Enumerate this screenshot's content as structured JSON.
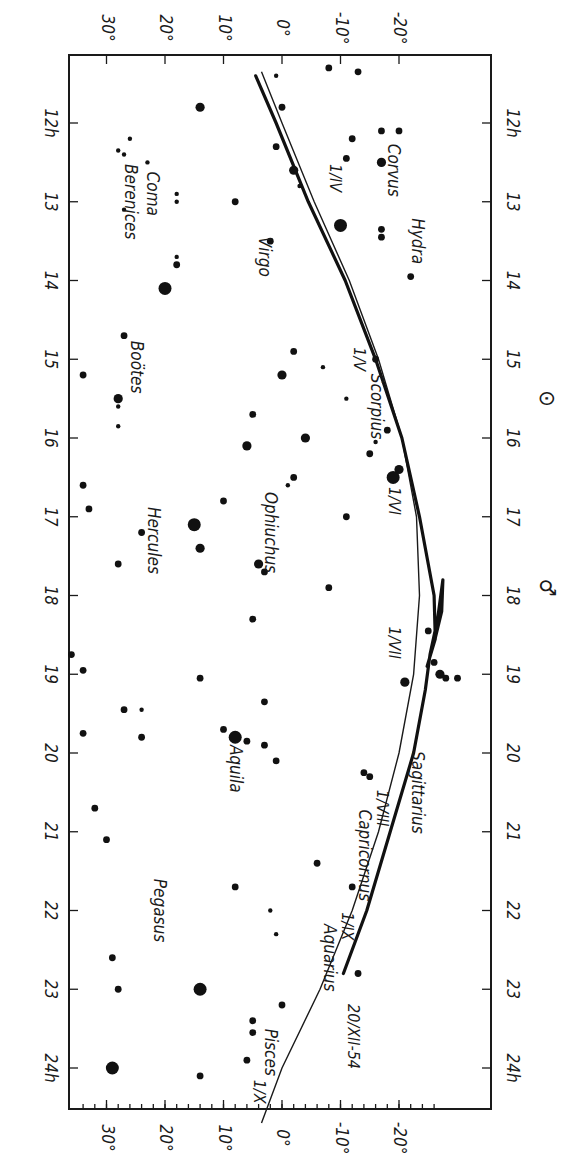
{
  "chart_data": {
    "type": "scatter",
    "title": "",
    "orientation": "rotated 90° clockwise (right ascension runs down the page, declination across)",
    "xlabel": "Right Ascension (h)",
    "ylabel": "Declination (°)",
    "ra_ticks": [
      "12h",
      "13",
      "14",
      "15",
      "16",
      "17",
      "18",
      "19",
      "20",
      "21",
      "22",
      "23",
      "24h"
    ],
    "dec_ticks": [
      "30°",
      "20°",
      "10°",
      "0°",
      "-10°",
      "-20°"
    ],
    "ra_range": [
      11.1,
      25.0
    ],
    "dec_range": [
      36,
      -27
    ],
    "constellations": [
      {
        "name": "Coma Berenices",
        "ra": 13.0,
        "dec": 24
      },
      {
        "name": "Boötes",
        "ra": 15.1,
        "dec": 25
      },
      {
        "name": "Hercules",
        "ra": 17.3,
        "dec": 22
      },
      {
        "name": "Pegasus",
        "ra": 22.0,
        "dec": 21
      },
      {
        "name": "Virgo",
        "ra": 13.7,
        "dec": 3
      },
      {
        "name": "Ophiuchus",
        "ra": 17.2,
        "dec": 2
      },
      {
        "name": "Aquila",
        "ra": 20.2,
        "dec": 8
      },
      {
        "name": "Aquarius",
        "ra": 22.6,
        "dec": -8
      },
      {
        "name": "Pisces",
        "ra": 23.8,
        "dec": 2
      },
      {
        "name": "Corvus",
        "ra": 12.6,
        "dec": -19
      },
      {
        "name": "Hydra",
        "ra": 13.5,
        "dec": -23
      },
      {
        "name": "Scorpius",
        "ra": 15.6,
        "dec": -16
      },
      {
        "name": "Capricornus",
        "ra": 21.3,
        "dec": -14
      },
      {
        "name": "Sagittarius",
        "ra": 20.5,
        "dec": -23
      }
    ],
    "series": [
      {
        "name": "Ecliptic",
        "type": "line",
        "points": [
          [
            11.35,
            3.5
          ],
          [
            12,
            0
          ],
          [
            13,
            -5.5
          ],
          [
            14,
            -11.5
          ],
          [
            15,
            -16.5
          ],
          [
            16,
            -20.5
          ],
          [
            17,
            -23
          ],
          [
            18,
            -23.5
          ],
          [
            19,
            -22.5
          ],
          [
            20,
            -20
          ],
          [
            21,
            -16.5
          ],
          [
            22,
            -12
          ],
          [
            23,
            -6.5
          ],
          [
            24,
            0
          ],
          [
            24.7,
            3.5
          ]
        ]
      },
      {
        "name": "Mars path 1954",
        "type": "line",
        "points": [
          [
            11.4,
            4.5
          ],
          [
            12,
            1
          ],
          [
            13,
            -4.5
          ],
          [
            14,
            -10.8
          ],
          [
            15,
            -16
          ],
          [
            16,
            -20.5
          ],
          [
            17,
            -23.5
          ],
          [
            18,
            -26
          ],
          [
            18.55,
            -26.2
          ],
          [
            18.9,
            -24.8
          ],
          [
            18.6,
            -26
          ],
          [
            18.2,
            -27.3
          ],
          [
            17.8,
            -27.5
          ],
          [
            18.3,
            -26.6
          ],
          [
            18.75,
            -25.3
          ],
          [
            19.2,
            -24.5
          ],
          [
            20,
            -22.5
          ],
          [
            21,
            -18.5
          ],
          [
            22,
            -14.5
          ],
          [
            22.8,
            -10.5
          ]
        ]
      }
    ],
    "date_labels": [
      {
        "text": "1/IV",
        "ra": 12.7,
        "dec": -9
      },
      {
        "text": "1/V",
        "ra": 15.0,
        "dec": -13
      },
      {
        "text": "1/VI",
        "ra": 16.8,
        "dec": -19
      },
      {
        "text": "1/VII",
        "ra": 18.6,
        "dec": -19
      },
      {
        "text": "1/VIII",
        "ra": 20.7,
        "dec": -17
      },
      {
        "text": "1/IX",
        "ra": 22.2,
        "dec": -11
      },
      {
        "text": "1/X",
        "ra": 24.3,
        "dec": 4
      },
      {
        "text": "20/XII-54",
        "ra": 23.6,
        "dec": -12
      }
    ],
    "symbols": [
      {
        "name": "Sun",
        "glyph": "⊙",
        "ra": 15.5
      },
      {
        "name": "Mars",
        "glyph": "♂",
        "ra": 17.9
      }
    ],
    "stars": [
      [
        11.3,
        -8,
        2
      ],
      [
        11.35,
        -13,
        2
      ],
      [
        11.4,
        1,
        1
      ],
      [
        11.8,
        14,
        3
      ],
      [
        11.8,
        0,
        2
      ],
      [
        12.1,
        -17,
        2
      ],
      [
        12.1,
        -20,
        2
      ],
      [
        12.2,
        -12,
        2
      ],
      [
        12.2,
        26,
        1
      ],
      [
        12.3,
        1,
        2
      ],
      [
        12.35,
        28,
        1
      ],
      [
        12.4,
        27,
        1
      ],
      [
        12.45,
        -11,
        2
      ],
      [
        12.5,
        -17,
        3
      ],
      [
        12.5,
        23,
        1
      ],
      [
        12.6,
        -2,
        3
      ],
      [
        12.8,
        -3,
        1
      ],
      [
        12.9,
        18,
        1
      ],
      [
        13.0,
        8,
        2
      ],
      [
        13.0,
        18,
        1
      ],
      [
        13.1,
        27,
        1
      ],
      [
        13.3,
        -10,
        4
      ],
      [
        13.35,
        -17,
        2
      ],
      [
        13.45,
        -17,
        2
      ],
      [
        13.5,
        2,
        2
      ],
      [
        13.7,
        18,
        1
      ],
      [
        13.8,
        18,
        2
      ],
      [
        13.95,
        -22,
        2
      ],
      [
        14.1,
        20,
        4
      ],
      [
        14.7,
        27,
        2
      ],
      [
        14.9,
        -2,
        2
      ],
      [
        15.0,
        -16,
        2
      ],
      [
        15.1,
        -7,
        1
      ],
      [
        15.2,
        34,
        2
      ],
      [
        15.2,
        0,
        3
      ],
      [
        15.5,
        28,
        3
      ],
      [
        15.5,
        -11,
        1
      ],
      [
        15.6,
        28,
        1
      ],
      [
        15.7,
        5,
        2
      ],
      [
        15.85,
        28,
        1
      ],
      [
        15.9,
        -18,
        2
      ],
      [
        16.0,
        -4,
        3
      ],
      [
        16.05,
        -16,
        1
      ],
      [
        16.1,
        6,
        3
      ],
      [
        16.2,
        -15,
        2
      ],
      [
        16.4,
        -20,
        3
      ],
      [
        16.5,
        -2,
        2
      ],
      [
        16.5,
        -19,
        4
      ],
      [
        16.6,
        34,
        2
      ],
      [
        16.6,
        -1,
        1
      ],
      [
        16.9,
        33,
        2
      ],
      [
        16.8,
        10,
        2
      ],
      [
        17.0,
        -11,
        2
      ],
      [
        17.1,
        15,
        4
      ],
      [
        17.2,
        24,
        2
      ],
      [
        17.4,
        14,
        3
      ],
      [
        17.6,
        28,
        2
      ],
      [
        17.6,
        4,
        3
      ],
      [
        17.7,
        3,
        2
      ],
      [
        17.9,
        -8,
        2
      ],
      [
        18.3,
        5,
        2
      ],
      [
        18.45,
        -25,
        2
      ],
      [
        18.75,
        36,
        2
      ],
      [
        18.85,
        -26,
        2
      ],
      [
        18.95,
        34,
        2
      ],
      [
        19.05,
        14,
        2
      ],
      [
        19.1,
        -21,
        3
      ],
      [
        19.0,
        -27,
        3
      ],
      [
        19.05,
        -28,
        2
      ],
      [
        19.05,
        -30,
        2
      ],
      [
        19.35,
        3,
        2
      ],
      [
        19.45,
        27,
        2
      ],
      [
        19.45,
        24,
        1
      ],
      [
        19.7,
        10,
        2
      ],
      [
        19.75,
        34,
        2
      ],
      [
        19.8,
        8,
        4
      ],
      [
        19.8,
        24,
        2
      ],
      [
        19.85,
        6,
        2
      ],
      [
        19.9,
        3,
        2
      ],
      [
        20.1,
        1,
        2
      ],
      [
        20.25,
        -14,
        2
      ],
      [
        20.3,
        -15,
        2
      ],
      [
        20.7,
        32,
        2
      ],
      [
        21.1,
        30,
        2
      ],
      [
        21.4,
        -6,
        2
      ],
      [
        21.7,
        8,
        2
      ],
      [
        21.7,
        -12,
        2
      ],
      [
        22.0,
        2,
        1
      ],
      [
        22.3,
        1,
        1
      ],
      [
        22.6,
        29,
        2
      ],
      [
        22.8,
        -13,
        2
      ],
      [
        23.0,
        28,
        2
      ],
      [
        23.0,
        14,
        4
      ],
      [
        23.2,
        0,
        2
      ],
      [
        23.4,
        5,
        2
      ],
      [
        23.55,
        5,
        2
      ],
      [
        23.9,
        6,
        2
      ],
      [
        24.0,
        29,
        4
      ],
      [
        24.1,
        14,
        2
      ]
    ],
    "legend": "none",
    "grid": false
  }
}
